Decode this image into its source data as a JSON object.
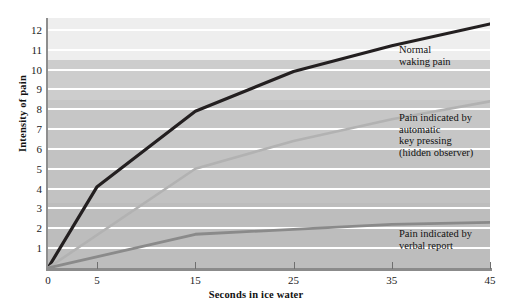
{
  "chart_data": {
    "type": "line",
    "title": "",
    "xlabel": "Seconds in ice water",
    "ylabel": "Intensity of pain",
    "xlim": [
      0,
      45
    ],
    "ylim": [
      0,
      12.6
    ],
    "grid": true,
    "legend_position": "inline-annotations",
    "xticks": [
      0,
      5,
      15,
      25,
      35,
      45
    ],
    "xtick_labels": [
      "0",
      "5",
      "15",
      "25",
      "35",
      "45"
    ],
    "yticks": [
      1,
      2,
      3,
      4,
      5,
      6,
      7,
      8,
      9,
      10,
      11,
      12
    ],
    "ytick_labels": [
      "1",
      "2",
      "3",
      "4",
      "5",
      "6",
      "7",
      "8",
      "9",
      "10",
      "11",
      "12"
    ],
    "series": [
      {
        "name": "Normal waking pain",
        "label": "Normal\nwaking pain",
        "color": "#231f20",
        "width": 3.2,
        "x": [
          0,
          5,
          15,
          25,
          35,
          45
        ],
        "y": [
          0,
          4.1,
          7.9,
          9.9,
          11.2,
          12.3
        ]
      },
      {
        "name": "Pain indicated by automatic key pressing (hidden observer)",
        "label": "Pain indicated by\nautomatic\nkey pressing\n(hidden observer)",
        "color": "#b2b2b2",
        "width": 2.6,
        "x": [
          0,
          15,
          25,
          35,
          45
        ],
        "y": [
          0,
          5.0,
          6.4,
          7.5,
          8.4
        ]
      },
      {
        "name": "Pain indicated by verbal report",
        "label": "Pain indicated by\nverbal report",
        "color": "#8a8a8a",
        "width": 2.8,
        "x": [
          0,
          15,
          35,
          45
        ],
        "y": [
          0,
          1.7,
          2.2,
          2.3
        ]
      }
    ]
  },
  "axes": {
    "y_axis_title": "Intensity of pain",
    "x_axis_title": "Seconds in ice water"
  },
  "colors": {
    "plot_background_top": "#eeeeee",
    "plot_background_bottom": "#bdbdbd",
    "gridline": "#ffffff",
    "axis": "#8b8b8b",
    "text": "#111111"
  }
}
